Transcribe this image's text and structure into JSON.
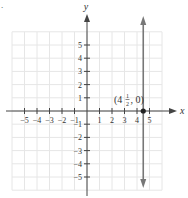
{
  "problem_mark": ".",
  "chart_data": {
    "type": "line",
    "title": "",
    "xlabel": "x",
    "ylabel": "y",
    "xlim": [
      -6,
      6
    ],
    "ylim": [
      -6,
      6
    ],
    "grid": true,
    "x_ticks": [
      -5,
      -4,
      -3,
      -2,
      -1,
      1,
      2,
      3,
      4,
      5
    ],
    "y_ticks": [
      -5,
      -4,
      -3,
      -2,
      -1,
      1,
      2,
      3,
      4,
      5
    ],
    "x_tick_labels": [
      "−5",
      "−4",
      "−3",
      "−2",
      "−1",
      "1",
      "2",
      "3",
      "4",
      "5"
    ],
    "y_tick_labels": [
      "−5",
      "−4",
      "−3",
      "−2",
      "−1",
      "1",
      "2",
      "3",
      "4",
      "5"
    ],
    "series": [
      {
        "name": "x = 4 1/2",
        "kind": "vertical-line",
        "x": 4.5,
        "arrows": "both",
        "color": "#777777"
      }
    ],
    "points": [
      {
        "x": 4.5,
        "y": 0,
        "label_whole": "(4",
        "label_num": "1",
        "label_den": "2",
        "label_tail": ", 0)",
        "color": "#222222"
      }
    ],
    "annotations": [
      "(4½, 0)"
    ]
  },
  "colors": {
    "axis": "#444444",
    "grid": "#e6e6e6",
    "line": "#777777",
    "point": "#222222"
  }
}
